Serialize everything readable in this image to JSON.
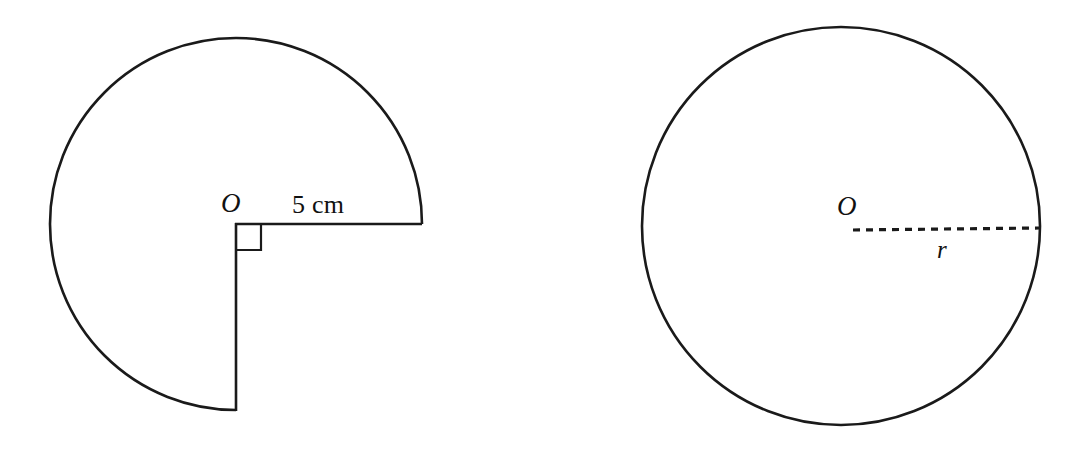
{
  "page": {
    "background_color": "#ffffff",
    "stroke_color": "#1a1a1a",
    "width": 1091,
    "height": 453
  },
  "figures": [
    {
      "id": "left-figure",
      "kind": "three-quarter-circle-sector",
      "description": "Three-quarter circle (270 degree sector) with centre O, right angle marked at centre, radius labelled 5 cm",
      "center": {
        "x": 236,
        "y": 224
      },
      "radius": 186,
      "sector_start_angle_deg": 0,
      "sector_sweep_deg": 270,
      "labels": {
        "center": "O",
        "radius": "5 cm"
      },
      "right_angle_marker": {
        "present": true,
        "size": 25
      }
    },
    {
      "id": "right-figure",
      "kind": "circle",
      "description": "Full circle with centre O and dashed radius labelled r",
      "center": {
        "x": 841,
        "y": 226
      },
      "radius": 199,
      "radius_line_style": "dashed",
      "labels": {
        "center": "O",
        "radius": "r"
      }
    }
  ],
  "left_labels": {
    "center_point": "O",
    "radius_measure": "5 cm"
  },
  "right_labels": {
    "center_point": "O",
    "radius_variable": "r"
  }
}
